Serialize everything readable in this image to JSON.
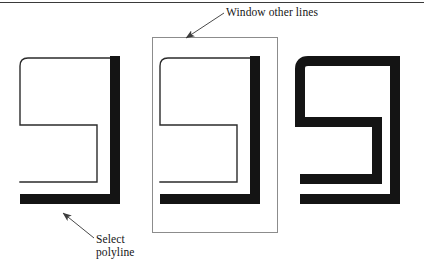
{
  "figure": {
    "background_color": "#ffffff",
    "ink_color": "#141414",
    "thin_stroke_color": "#2b2b2b",
    "window_stroke_color": "#8c8c8c",
    "leader_color": "#4a4a4a",
    "top_rule_color": "#3a3a3a"
  },
  "annotations": {
    "window_label": "Window other lines",
    "select_label_line1": "Select",
    "select_label_line2": "polyline"
  },
  "diagram_data": {
    "type": "diagram",
    "kind": "cad-polyline-width-sequence",
    "panel_count": 3,
    "panels": [
      {
        "index": 1,
        "name": "before-selection",
        "caption": "Select polyline",
        "thin_lines": true,
        "thick_segments": [
          "right-vertical",
          "bottom-horizontal"
        ],
        "has_window_rectangle": false
      },
      {
        "index": 2,
        "name": "window-selection",
        "caption": "Window other lines",
        "thin_lines": true,
        "thick_segments": [
          "right-vertical",
          "bottom-horizontal"
        ],
        "has_window_rectangle": true
      },
      {
        "index": 3,
        "name": "after-width-applied",
        "caption": "",
        "thin_lines": false,
        "thick_segments": [
          "all"
        ],
        "has_window_rectangle": false
      }
    ],
    "shape": {
      "description": "G-shaped open polyline with rounded upper-left corner and a rectangular inner notch opening to the left",
      "rounded_corners": [
        "top-left"
      ],
      "thick_width_px": 10,
      "thin_width_px": 1
    },
    "leaders": [
      {
        "name": "window-leader",
        "label": "Window other lines",
        "from": [
          224,
          14
        ],
        "to": [
          183,
          40
        ],
        "arrowhead": "to"
      },
      {
        "name": "select-leader",
        "label": "Select polyline",
        "from": [
          93,
          238
        ],
        "to": [
          60,
          214
        ],
        "arrowhead": "to"
      }
    ]
  }
}
